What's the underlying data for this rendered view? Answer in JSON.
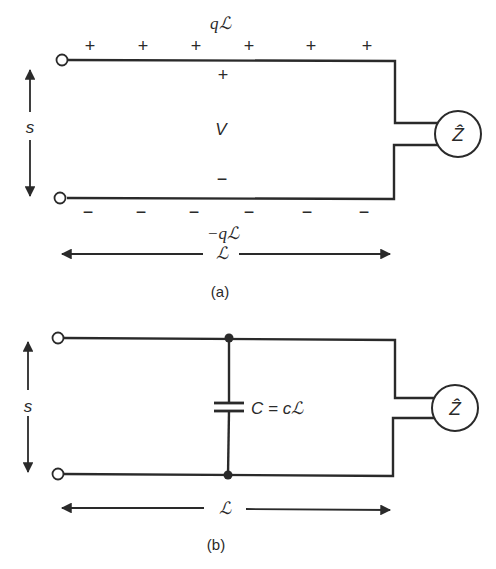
{
  "figure_a": {
    "caption": "(a)",
    "top_charge_label": "qℒ",
    "bottom_charge_label": "−qℒ",
    "plus_signs": [
      "+",
      "+",
      "+",
      "+",
      "+",
      "+"
    ],
    "minus_signs": [
      "−",
      "−",
      "−",
      "−",
      "−",
      "−"
    ],
    "inner_plus": "+",
    "inner_minus": "−",
    "voltage_label": "V",
    "separation_label": "s",
    "length_label": "ℒ",
    "impedance_label": "Ẑ"
  },
  "figure_b": {
    "caption": "(b)",
    "capacitor_label": "C = cℒ",
    "separation_label": "s",
    "length_label": "ℒ",
    "impedance_label": "Ẑ"
  },
  "colors": {
    "ink": "#2a2a2a",
    "background": "#ffffff"
  }
}
